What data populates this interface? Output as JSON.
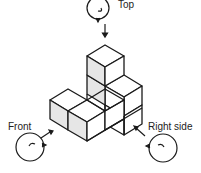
{
  "diagram": {
    "type": "isometric-cube-views",
    "labels": {
      "top": "Top",
      "front": "Front",
      "right": "Right side"
    },
    "colors": {
      "line": "#1a1a1a",
      "shaded_face": "#e6e6e6",
      "face": "#ffffff"
    },
    "cube_count": 7,
    "viewpoints": [
      "top-eye-icon",
      "front-eye-icon",
      "right-side-eye-icon"
    ]
  }
}
